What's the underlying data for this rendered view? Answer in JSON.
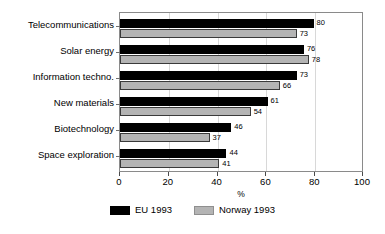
{
  "chart_data": {
    "type": "bar",
    "orientation": "horizontal",
    "title": "",
    "xlabel": "%",
    "ylabel": "",
    "xlim": [
      0,
      100
    ],
    "xticks": [
      0,
      20,
      40,
      60,
      80,
      100
    ],
    "xtick_labels": [
      "0",
      "20",
      "40",
      "60",
      "80",
      "100"
    ],
    "grid": true,
    "legend_position": "bottom",
    "categories": [
      "Telecommunications",
      "Solar energy",
      "Information techno.",
      "New materials",
      "Biotechnology",
      "Space exploration"
    ],
    "series": [
      {
        "name": "EU 1993",
        "color": "#000000",
        "values": [
          80,
          76,
          73,
          61,
          46,
          44
        ],
        "value_labels": [
          "80",
          "76",
          "73",
          "61",
          "46",
          "44"
        ]
      },
      {
        "name": "Norway 1993",
        "color": "#b4b4b4",
        "values": [
          73,
          78,
          66,
          54,
          37,
          41
        ],
        "value_labels": [
          "73",
          "78",
          "66",
          "54",
          "37",
          "41"
        ]
      }
    ]
  }
}
